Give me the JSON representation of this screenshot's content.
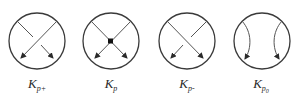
{
  "figure": {
    "type": "knot-diagram-local-moves",
    "stroke_color": "#3a3a3a",
    "line_color": "#555555",
    "items": [
      {
        "id": "positive-crossing",
        "label_main": "K",
        "label_sub": "p+",
        "label_subsub": "",
        "kind": "crossing",
        "over_strand": "top-right-to-bottom-left",
        "vertex": false
      },
      {
        "id": "singular-crossing",
        "label_main": "K",
        "label_sub": "p",
        "label_subsub": "",
        "kind": "singular",
        "over_strand": "none",
        "vertex": true
      },
      {
        "id": "negative-crossing",
        "label_main": "K",
        "label_sub": "p-",
        "label_subsub": "",
        "kind": "crossing",
        "over_strand": "top-left-to-bottom-right",
        "vertex": false
      },
      {
        "id": "oriented-smoothing",
        "label_main": "K",
        "label_sub": "p",
        "label_subsub": "0",
        "kind": "smoothing",
        "over_strand": "none",
        "vertex": false
      }
    ]
  }
}
